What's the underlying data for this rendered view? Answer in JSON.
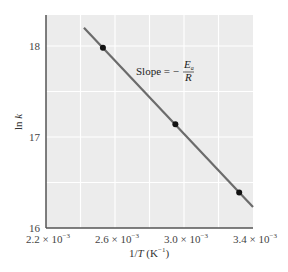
{
  "chart_data": {
    "type": "scatter",
    "title": "",
    "xlabel": "1/T (K⁻¹)",
    "ylabel": "ln k",
    "xlim": [
      0.0022,
      0.0034
    ],
    "ylim": [
      16,
      18.35
    ],
    "x_ticks": [
      0.0022,
      0.0026,
      0.003,
      0.0034
    ],
    "x_tick_labels": [
      {
        "mantissa": "2.2",
        "exp": "−3"
      },
      {
        "mantissa": "2.6",
        "exp": "−3"
      },
      {
        "mantissa": "3.0",
        "exp": "−3"
      },
      {
        "mantissa": "3.4",
        "exp": "−3"
      }
    ],
    "y_ticks": [
      16,
      17,
      18
    ],
    "y_tick_labels": [
      "16",
      "17",
      "18"
    ],
    "grid": true,
    "legend": null,
    "series": [
      {
        "name": "data points",
        "kind": "scatter",
        "x": [
          0.00253,
          0.00295,
          0.00332
        ],
        "y": [
          17.98,
          17.14,
          16.39
        ],
        "color": "#111111"
      },
      {
        "name": "best-fit line",
        "kind": "line",
        "x": [
          0.00242,
          0.0034
        ],
        "y": [
          18.2,
          16.23
        ],
        "color": "#6b6b6b"
      }
    ],
    "annotations": [
      {
        "text": "Slope = − Ea/R",
        "x": 0.0027,
        "y": 17.8
      }
    ]
  },
  "labels": {
    "xlabel_prefix": "1/",
    "xlabel_var": "T",
    "xlabel_unit": " (K",
    "xlabel_unit_exp": "−1",
    "xlabel_close": ")",
    "ylabel_fn": "ln ",
    "ylabel_var": "k",
    "slope_text": "Slope = −",
    "slope_num": "E",
    "slope_num_sub": "a",
    "slope_den": "R",
    "times": "× 10"
  },
  "colors": {
    "plot_bg": "#ececec",
    "grid": "#ffffff",
    "axis": "#555555",
    "line": "#6b6b6b",
    "marker": "#111111"
  }
}
